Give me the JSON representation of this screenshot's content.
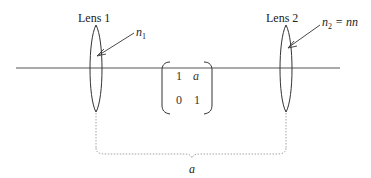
{
  "diagram": {
    "lens1": {
      "label": "Lens 1",
      "index_symbol": "n",
      "index_subscript": "1",
      "index_suffix": ""
    },
    "lens2": {
      "label": "Lens 2",
      "index_symbol": "n",
      "index_subscript": "2",
      "index_suffix": " = nn"
    },
    "matrix": {
      "rows": [
        [
          "1",
          "a"
        ],
        [
          "0",
          "1"
        ]
      ]
    },
    "distance_label": "a",
    "colors": {
      "line": "#555555",
      "lens": "#333333",
      "dotted": "#9a9a9a",
      "text": "#222222"
    }
  }
}
